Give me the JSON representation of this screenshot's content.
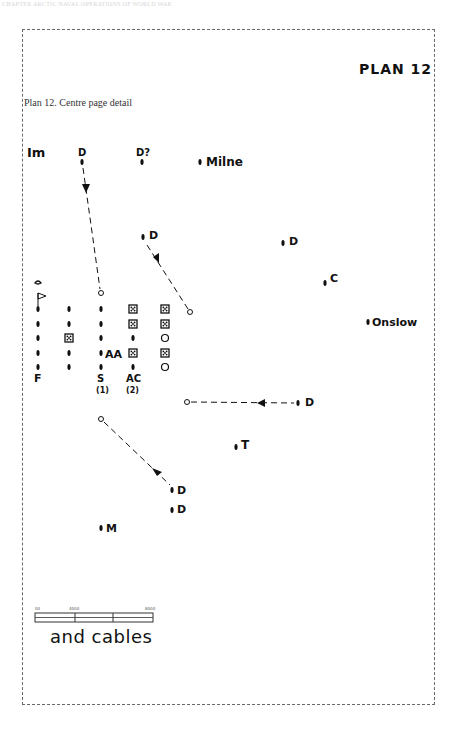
{
  "page": {
    "running_head": "CHAPTER ARCTIC NAVAL OPERATIONS OF WORLD WAR"
  },
  "plan": {
    "title": "PLAN 12",
    "caption": "Plan 12. Centre page detail"
  },
  "labels": {
    "im": "Im",
    "d_top": "D",
    "d_question": "D?",
    "milne": "Milne",
    "d_mid": "D",
    "d_right": "D",
    "c": "C",
    "onslow": "Onslow",
    "aa": "AA",
    "f": "F",
    "s": "S",
    "s_num": "(1)",
    "ac": "AC",
    "ac_num": "(2)",
    "d_east": "D",
    "t": "T",
    "d_south1": "D",
    "d_south2": "D",
    "m": "M"
  },
  "convoy": {
    "columns": [
      {
        "x": 38,
        "items": [
          "dot",
          "dot",
          "dot",
          "dot",
          "dot"
        ]
      },
      {
        "x": 69,
        "items": [
          "dot",
          "dot",
          "box",
          "dot",
          "dot"
        ]
      },
      {
        "x": 101,
        "items": [
          "dot",
          "dot",
          "dot",
          "dot",
          "dot"
        ]
      },
      {
        "x": 133,
        "items": [
          "box",
          "box",
          "dot",
          "box",
          "dot"
        ]
      },
      {
        "x": 165,
        "items": [
          "box",
          "box",
          "circle",
          "box",
          "circle"
        ]
      }
    ]
  },
  "scale": {
    "ticks": [
      "00",
      "4000",
      "8000"
    ],
    "legend": "and cables"
  }
}
